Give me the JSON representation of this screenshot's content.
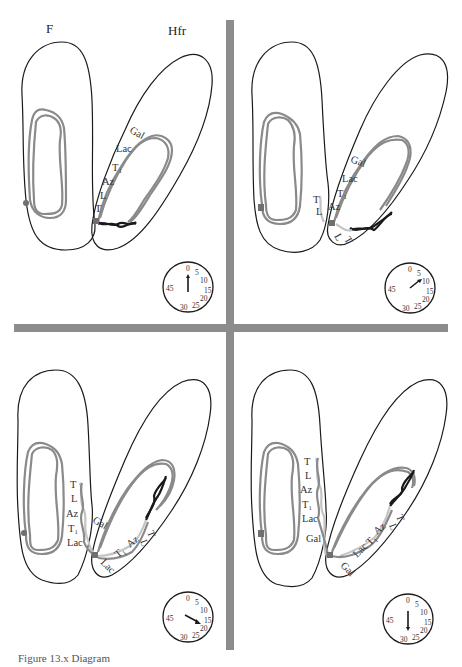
{
  "figure": {
    "headers": {
      "f_cell": "F",
      "hfr_cell": "Hfr"
    },
    "caption": "Figure 13.x  Diagram",
    "colors": {
      "divider": "#8c8c8c",
      "recipient_dna": "#8a8a8a",
      "transferred_dna": "#c4c4c4",
      "f_factor": "#1a1a1a",
      "outline": "#1a1a1a"
    },
    "gene_order": [
      "T",
      "L",
      "Az",
      "T1",
      "Lac",
      "Gal"
    ],
    "panels": [
      {
        "id": "panel-1",
        "time_minutes": 0,
        "genes": {
          "gal": "Gal",
          "lac": "Lac",
          "t1": "T₁",
          "az": "Az",
          "l": "L",
          "t": "T"
        }
      },
      {
        "id": "panel-2",
        "time_minutes": 10,
        "genes": {
          "gal": "Gal",
          "lac": "Lac",
          "t1": "T₁",
          "az": "Az",
          "l": "L",
          "t": "T",
          "t_out": "T",
          "l_out": "L"
        }
      },
      {
        "id": "panel-3",
        "time_minutes": 20,
        "transferred": {
          "t": "T",
          "l": "L",
          "az": "Az",
          "t1": "T₁",
          "lac": "Lac"
        },
        "donor": {
          "gal": "Gal",
          "t": "T",
          "l": "L",
          "az": "Az",
          "t1": "T₁",
          "lac": "Lac"
        }
      },
      {
        "id": "panel-4",
        "time_minutes": 30,
        "transferred": {
          "t": "T",
          "l": "L",
          "az": "Az",
          "t1": "T₁",
          "lac": "Lac",
          "gal": "Gal"
        },
        "donor": {
          "t": "T",
          "l": "L",
          "az": "Az",
          "t1": "T₁",
          "lac": "Lac",
          "gal": "Gal"
        }
      }
    ],
    "clock": {
      "labels": {
        "m0": "0",
        "m5": "5",
        "m10": "10",
        "m15": "15",
        "m20": "20",
        "m25": "25",
        "m30": "30",
        "m45": "45"
      }
    }
  }
}
